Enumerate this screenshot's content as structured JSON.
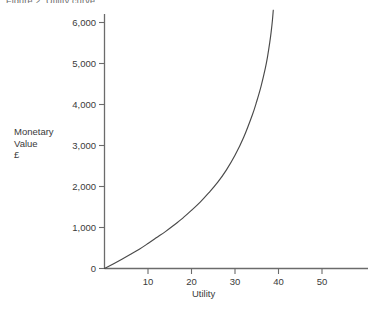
{
  "figure": {
    "title": "Figure 2: Utility curve",
    "background": "#ffffff",
    "ink_color": "#4a4a4a"
  },
  "labels": {
    "y_axis_title": "Monetary\nValue\n£",
    "x_axis_title": "Utility"
  },
  "chart_data": {
    "type": "line",
    "title": "Figure 2: Utility curve",
    "xlabel": "Utility",
    "ylabel": "Monetary Value £",
    "xlim": [
      0,
      61
    ],
    "ylim": [
      0,
      6400
    ],
    "grid": false,
    "legend": null,
    "x_ticks": [
      10,
      20,
      30,
      40,
      50
    ],
    "x_tick_labels": [
      "10",
      "20",
      "30",
      "40",
      "50"
    ],
    "y_ticks": [
      0,
      1000,
      2000,
      3000,
      4000,
      5000,
      6000
    ],
    "y_tick_labels": [
      "0",
      "1,000",
      "2,000",
      "3,000",
      "4,000",
      "5,000",
      "6,000"
    ],
    "series": [
      {
        "name": "Monetary value of utility",
        "x": [
          0,
          2,
          4,
          6,
          8,
          10,
          12,
          14,
          16,
          18,
          20,
          22,
          24,
          26,
          28,
          30,
          32,
          34,
          35,
          36,
          37,
          37.5,
          38,
          38.3,
          38.6,
          38.8
        ],
        "y": [
          0,
          110,
          225,
          345,
          470,
          610,
          755,
          900,
          1060,
          1230,
          1420,
          1620,
          1850,
          2100,
          2400,
          2760,
          3200,
          3750,
          4080,
          4450,
          4900,
          5180,
          5520,
          5760,
          6050,
          6300
        ]
      }
    ],
    "annotations": []
  }
}
